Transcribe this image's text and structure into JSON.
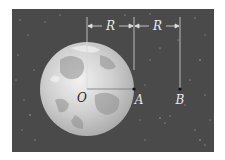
{
  "diagram": {
    "title": "",
    "colors": {
      "background": "#ffffff",
      "space": "#4a4a4a",
      "planet_light": "#e6e6e6",
      "planet_dark": "#9a9a9a",
      "lines": "#dcdcdc",
      "points": "#111111"
    },
    "dimension_labels": [
      {
        "id": "r1",
        "text": "R"
      },
      {
        "id": "r2",
        "text": "R"
      }
    ],
    "points": [
      {
        "id": "O",
        "text": "O"
      },
      {
        "id": "A",
        "text": "A"
      },
      {
        "id": "B",
        "text": "B"
      }
    ]
  }
}
